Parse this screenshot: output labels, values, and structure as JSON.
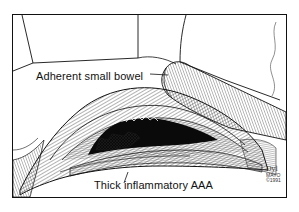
{
  "figure": {
    "type": "medical-illustration",
    "style": "black-and-white pen-and-ink",
    "labels": [
      {
        "id": "bowel",
        "text": "Adherent small bowel"
      },
      {
        "id": "aaa",
        "text": "Thick inflammatory AAA"
      }
    ],
    "signature": {
      "initials": "Dyl",
      "line2": "MAYO",
      "line3": "©1991"
    },
    "colors": {
      "ink": "#111111",
      "background": "#ffffff"
    }
  }
}
